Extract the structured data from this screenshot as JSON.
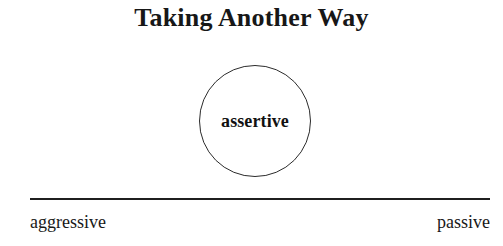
{
  "diagram": {
    "title": "Taking Another Way",
    "type": "spectrum-with-node",
    "node": {
      "label": "assertive",
      "shape": "circle"
    },
    "axis": {
      "left_label": "aggressive",
      "right_label": "passive"
    },
    "colors": {
      "background": "#ffffff",
      "text": "#141414",
      "stroke": "#2b2b2b",
      "axis": "#1f1f1f"
    }
  }
}
